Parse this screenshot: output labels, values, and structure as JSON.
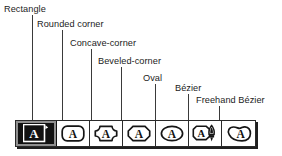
{
  "figure": {
    "kind": "annotated-toolbar-diagram",
    "background_color": "#ffffff",
    "line_color": "#3a3a3a",
    "text_color": "#1c1c1c"
  },
  "callouts": [
    {
      "label": "Rectangle",
      "target_tool": "rectangle"
    },
    {
      "label": "Rounded corner",
      "target_tool": "rounded-corner"
    },
    {
      "label": "Concave-corner",
      "target_tool": "concave-corner"
    },
    {
      "label": "Beveled-corner",
      "target_tool": "beveled-corner"
    },
    {
      "label": "Oval",
      "target_tool": "oval"
    },
    {
      "label": "Bézier",
      "target_tool": "bezier"
    },
    {
      "label": "Freehand Bézier",
      "target_tool": "freehand-bezier"
    }
  ],
  "toolbar": {
    "name": "text-frame-shape-toolbar",
    "selected_index": 0,
    "selected_color": "#121212",
    "border_color": "#2a2a2a",
    "button_background": "#ffffff",
    "buttons": [
      {
        "id": "rectangle",
        "tooltip": "Rectangle",
        "icon": "text-frame-rectangle-icon",
        "letter": "A",
        "selected": true
      },
      {
        "id": "rounded-corner",
        "tooltip": "Rounded corner",
        "icon": "text-frame-rounded-icon",
        "letter": "A",
        "selected": false
      },
      {
        "id": "concave-corner",
        "tooltip": "Concave-corner",
        "icon": "text-frame-concave-icon",
        "letter": "A",
        "selected": false
      },
      {
        "id": "beveled-corner",
        "tooltip": "Beveled-corner",
        "icon": "text-frame-beveled-icon",
        "letter": "A",
        "selected": false
      },
      {
        "id": "oval",
        "tooltip": "Oval",
        "icon": "text-frame-oval-icon",
        "letter": "A",
        "selected": false
      },
      {
        "id": "bezier",
        "tooltip": "Bézier",
        "icon": "text-frame-bezier-pen-icon",
        "letter": "A",
        "selected": false
      },
      {
        "id": "freehand-bezier",
        "tooltip": "Freehand Bézier",
        "icon": "text-frame-freehand-bezier-icon",
        "letter": "A",
        "selected": false
      }
    ]
  }
}
